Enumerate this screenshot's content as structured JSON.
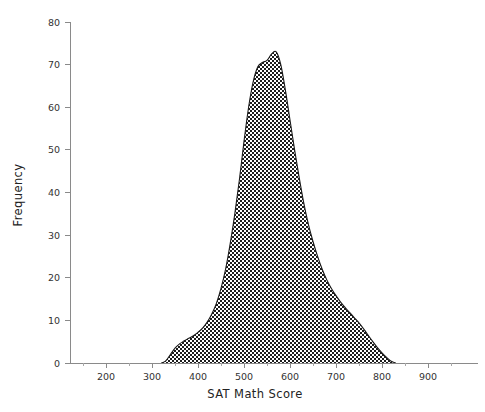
{
  "chart_data": {
    "type": "area",
    "title": "",
    "subtitle": "",
    "xlabel": "SAT Math Score",
    "ylabel": "Frequency",
    "xlim": [
      130,
      980
    ],
    "ylim": [
      0,
      80
    ],
    "grid": false,
    "legend": null,
    "legend_position": "none",
    "fill_pattern": "checkerboard",
    "x_ticks": [
      200,
      300,
      400,
      500,
      600,
      700,
      800,
      900
    ],
    "x_tick_labels": [
      "200",
      "300",
      "400",
      "500",
      "600",
      "700",
      "800",
      "900"
    ],
    "x_minor_ticks": [
      150,
      250,
      350,
      450,
      550,
      650,
      750,
      850,
      950
    ],
    "y_ticks": [
      0,
      10,
      20,
      30,
      40,
      50,
      60,
      70,
      80
    ],
    "y_tick_labels": [
      "0",
      "10",
      "20",
      "30",
      "40",
      "50",
      "60",
      "70",
      "80"
    ],
    "peak_value": 73,
    "peak_x": 565,
    "x": [
      320,
      330,
      340,
      350,
      360,
      370,
      380,
      390,
      400,
      410,
      420,
      430,
      440,
      450,
      460,
      470,
      480,
      490,
      500,
      510,
      520,
      530,
      540,
      550,
      560,
      570,
      580,
      590,
      600,
      610,
      620,
      630,
      640,
      650,
      660,
      670,
      680,
      690,
      700,
      710,
      720,
      730,
      740,
      750,
      760,
      770,
      780,
      790,
      800,
      810,
      820,
      830
    ],
    "values": [
      0,
      0.5,
      2.0,
      3.5,
      4.5,
      5.2,
      5.8,
      6.4,
      7.2,
      8.2,
      9.6,
      11.5,
      14.0,
      17.5,
      22.0,
      28.0,
      35.0,
      43.0,
      52.0,
      60.0,
      66.0,
      69.5,
      70.5,
      71.0,
      72.5,
      73.0,
      70.0,
      64.0,
      57.0,
      50.0,
      43.5,
      37.5,
      32.5,
      28.5,
      25.0,
      22.0,
      19.5,
      17.5,
      15.8,
      14.3,
      13.0,
      11.8,
      10.6,
      9.4,
      8.0,
      6.5,
      5.0,
      3.6,
      2.4,
      1.3,
      0.4,
      0
    ]
  },
  "axes": {
    "x": {
      "title": "SAT Math Score",
      "ticks": [
        {
          "value": 200,
          "label": "200"
        },
        {
          "value": 300,
          "label": "300"
        },
        {
          "value": 400,
          "label": "400"
        },
        {
          "value": 500,
          "label": "500"
        },
        {
          "value": 600,
          "label": "600"
        },
        {
          "value": 700,
          "label": "700"
        },
        {
          "value": 800,
          "label": "800"
        },
        {
          "value": 900,
          "label": "900"
        }
      ]
    },
    "y": {
      "title": "Frequency",
      "ticks": [
        {
          "value": 0,
          "label": "0"
        },
        {
          "value": 10,
          "label": "10"
        },
        {
          "value": 20,
          "label": "20"
        },
        {
          "value": 30,
          "label": "30"
        },
        {
          "value": 40,
          "label": "40"
        },
        {
          "value": 50,
          "label": "50"
        },
        {
          "value": 60,
          "label": "60"
        },
        {
          "value": 70,
          "label": "70"
        },
        {
          "value": 80,
          "label": "80"
        }
      ]
    }
  },
  "colors": {
    "background": "#ffffff",
    "axis": "#8a8a8a",
    "text": "#2b2b2b",
    "fill_dark": "#1a1a1a",
    "fill_light": "#ffffff"
  }
}
